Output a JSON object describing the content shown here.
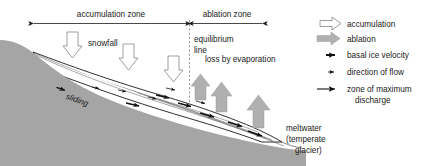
{
  "figure": {
    "type": "glacier-cross-section-diagram",
    "background_color": "#ffffff",
    "bedrock_color": "#a5a5a5",
    "ice_color": "#ffffff",
    "outline_color": "#1a1a1a"
  },
  "dimensions": {
    "accumulation_zone_label": "accumulation zone",
    "ablation_zone_label": "ablation zone"
  },
  "labels": {
    "equilibrium_line_1": "equilibrium",
    "equilibrium_line_2": "line",
    "snowfall": "snowfall",
    "sliding": "sliding",
    "loss_by_evaporation": "loss by evaporation",
    "meltwater_1": "meltwater",
    "meltwater_2": "(temperate",
    "meltwater_3": "glacier)"
  },
  "legend": {
    "items": [
      {
        "icon": "hollow-block-arrow-right-icon",
        "label": "accumulation"
      },
      {
        "icon": "filled-block-arrow-right-icon",
        "label": "ablation"
      },
      {
        "icon": "thick-arrow-right-icon",
        "label": "basal ice velocity"
      },
      {
        "icon": "thin-arrow-right-icon",
        "label": "direction of flow"
      },
      {
        "icon": "long-arrow-right-icon",
        "label": "zone of maximum"
      }
    ],
    "last_item_label_line2": "discharge"
  }
}
